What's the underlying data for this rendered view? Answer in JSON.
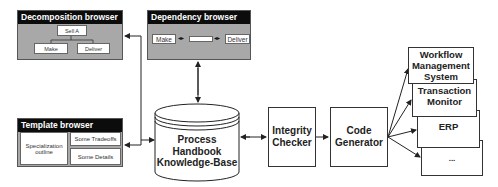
{
  "decomposition_browser": {
    "title": "Decomposition browser",
    "root": "Sell A",
    "children": [
      "Make",
      "Deliver"
    ]
  },
  "dependency_browser": {
    "title": "Dependency browser",
    "left": "Make",
    "right": "Deliver"
  },
  "template_browser": {
    "title": "Template browser",
    "left": "Specialization outline",
    "top_right": "Some Tradeoffs",
    "bottom_right": "Some Details"
  },
  "knowledge_base": {
    "label_line1": "Process",
    "label_line2": "Handbook",
    "label_line3": "Knowledge-Base"
  },
  "integrity_checker": {
    "line1": "Integrity",
    "line2": "Checker"
  },
  "code_generator": {
    "line1": "Code",
    "line2": "Generator"
  },
  "targets": [
    {
      "label": "Workflow Management System"
    },
    {
      "label": "Transaction Monitor"
    },
    {
      "label": "ERP"
    },
    {
      "label": "..."
    }
  ],
  "colors": {
    "panel_bg": "#a8a8a8",
    "title_bg": "#0c0c0c",
    "line": "#222222"
  }
}
